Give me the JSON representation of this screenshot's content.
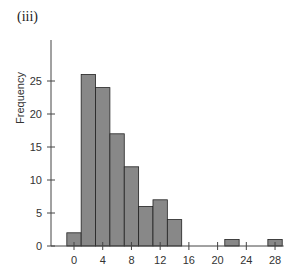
{
  "panel_label": "(iii)",
  "chart_data": {
    "type": "bar",
    "title": "",
    "xlabel": "",
    "ylabel": "Frequency",
    "bin_width": 2,
    "bins": [
      {
        "start": -1,
        "end": 1,
        "value": 2
      },
      {
        "start": 1,
        "end": 3,
        "value": 26
      },
      {
        "start": 3,
        "end": 5,
        "value": 24
      },
      {
        "start": 5,
        "end": 7,
        "value": 17
      },
      {
        "start": 7,
        "end": 9,
        "value": 12
      },
      {
        "start": 9,
        "end": 11,
        "value": 6
      },
      {
        "start": 11,
        "end": 13,
        "value": 7
      },
      {
        "start": 13,
        "end": 15,
        "value": 4
      },
      {
        "start": 21,
        "end": 23,
        "value": 1
      },
      {
        "start": 27,
        "end": 29,
        "value": 1
      }
    ],
    "categories": [
      "0",
      "2",
      "4",
      "6",
      "8",
      "10",
      "12",
      "14",
      "22",
      "28"
    ],
    "values": [
      2,
      26,
      24,
      17,
      12,
      6,
      7,
      4,
      1,
      1
    ],
    "xticks": [
      0,
      4,
      8,
      12,
      16,
      20,
      24,
      28
    ],
    "yticks": [
      0,
      5,
      10,
      15,
      20,
      25
    ],
    "xlim": [
      -2,
      29
    ],
    "ylim": [
      0,
      27
    ],
    "grid": false,
    "legend": null,
    "bar_color": "#888888",
    "bar_edge_color": "#222222"
  }
}
